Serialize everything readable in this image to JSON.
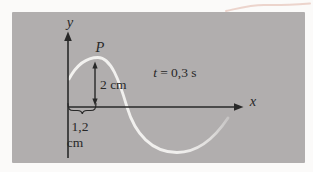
{
  "figure": {
    "kind": "transverse-wave-snapshot-diagram",
    "labels": {
      "y_axis": "y",
      "x_axis": "x",
      "point": "P",
      "amplitude": "2 cm",
      "time_var": "t",
      "time_rest": "= 0,3 s",
      "segment_line1": "1,2",
      "segment_line2": "cm"
    },
    "colors": {
      "panel_bg": "#b1aeae",
      "outer_bg": "#fbfaf9",
      "ink": "#282828",
      "wave": "#f5f4f2",
      "accent_line": "#e9ccc4"
    }
  }
}
